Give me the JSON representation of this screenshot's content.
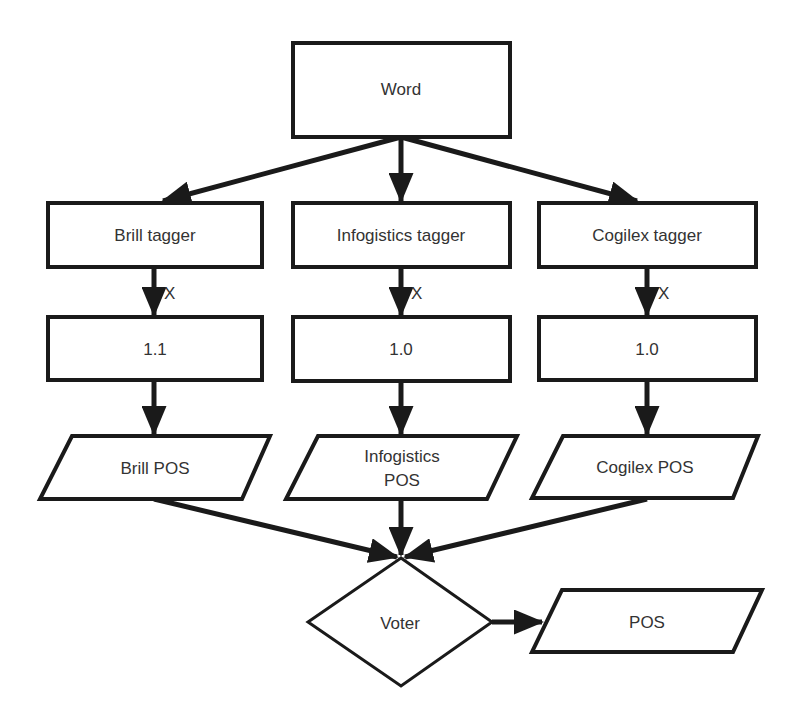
{
  "diagram": {
    "type": "flowchart",
    "colors": {
      "stroke": "#1a1a1a",
      "fill": "#ffffff",
      "text": "#333333",
      "background": "#ffffff"
    },
    "nodes": {
      "word": {
        "label": "Word",
        "shape": "rectangle"
      },
      "brill_tagger": {
        "label": "Brill tagger",
        "shape": "rectangle"
      },
      "infogistics_tagger": {
        "label": "Infogistics tagger",
        "shape": "rectangle"
      },
      "cogilex_tagger": {
        "label": "Cogilex tagger",
        "shape": "rectangle"
      },
      "brill_weight": {
        "label": "1.1",
        "shape": "rectangle"
      },
      "infogistics_weight": {
        "label": "1.0",
        "shape": "rectangle"
      },
      "cogilex_weight": {
        "label": "1.0",
        "shape": "rectangle"
      },
      "brill_pos": {
        "label": "Brill POS",
        "shape": "parallelogram"
      },
      "infogistics_pos": {
        "label_line1": "Infogistics",
        "label_line2": "POS",
        "shape": "parallelogram"
      },
      "cogilex_pos": {
        "label": "Cogilex POS",
        "shape": "parallelogram"
      },
      "voter": {
        "label": "Voter",
        "shape": "diamond"
      },
      "pos": {
        "label": "POS",
        "shape": "parallelogram"
      }
    },
    "edges": [
      {
        "from": "word",
        "to": "brill_tagger",
        "label": ""
      },
      {
        "from": "word",
        "to": "infogistics_tagger",
        "label": ""
      },
      {
        "from": "word",
        "to": "cogilex_tagger",
        "label": ""
      },
      {
        "from": "brill_tagger",
        "to": "brill_weight",
        "label": "X"
      },
      {
        "from": "infogistics_tagger",
        "to": "infogistics_weight",
        "label": "X"
      },
      {
        "from": "cogilex_tagger",
        "to": "cogilex_weight",
        "label": "X"
      },
      {
        "from": "brill_weight",
        "to": "brill_pos",
        "label": ""
      },
      {
        "from": "infogistics_weight",
        "to": "infogistics_pos",
        "label": ""
      },
      {
        "from": "cogilex_weight",
        "to": "cogilex_pos",
        "label": ""
      },
      {
        "from": "brill_pos",
        "to": "voter",
        "label": ""
      },
      {
        "from": "infogistics_pos",
        "to": "voter",
        "label": ""
      },
      {
        "from": "cogilex_pos",
        "to": "voter",
        "label": ""
      },
      {
        "from": "voter",
        "to": "pos",
        "label": ""
      }
    ],
    "edge_labels": {
      "brill_multiply": "X",
      "infogistics_multiply": "X",
      "cogilex_multiply": "X"
    }
  }
}
